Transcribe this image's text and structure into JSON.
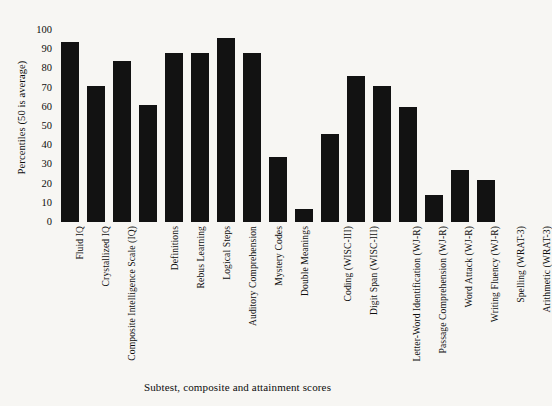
{
  "chart_data": {
    "type": "bar",
    "title": "",
    "xlabel": "Subtest, composite and attainment scores",
    "ylabel": "Percentiles (50 is average)",
    "ylim": [
      0,
      100
    ],
    "yticks": [
      "0",
      "10",
      "20",
      "30",
      "40",
      "50",
      "60",
      "70",
      "80",
      "90",
      "100"
    ],
    "grid": false,
    "legend": "none",
    "categories": [
      "Fluid IQ",
      "Crystallized IQ",
      "Composite Intelligence Scale (IQ)",
      "Definitions",
      "Rebus Learning",
      "Logical Steps",
      "Auditory Comprehension",
      "Mystery Codes",
      "Double Meanings",
      "Coding (WISC-III)",
      "Digit Span (WISC-III)",
      "Letter-Word  Identification (WJ-R)",
      "Passage Comprehension (WJ-R)",
      "Word Attack (WJ-R)",
      "Writing Fluency (WJ-R)",
      "Spelling (WRAT-3)",
      "Arithmetic (WRAT-3)"
    ],
    "values": [
      94,
      71,
      84,
      61,
      88,
      88,
      96,
      88,
      34,
      7,
      46,
      76,
      71,
      60,
      14,
      27,
      22
    ],
    "groups": [
      {
        "name": "composite-iq",
        "categories": [
          "Fluid IQ",
          "Crystallized IQ",
          "Composite Intelligence Scale (IQ)"
        ]
      },
      {
        "name": "kait-subtests",
        "categories": [
          "Definitions",
          "Rebus Learning",
          "Logical Steps",
          "Auditory Comprehension",
          "Mystery Codes",
          "Double Meanings"
        ]
      },
      {
        "name": "wisc-subtests",
        "categories": [
          "Coding (WISC-III)",
          "Digit Span (WISC-III)"
        ]
      },
      {
        "name": "attainment",
        "categories": [
          "Letter-Word  Identification (WJ-R)",
          "Passage Comprehension (WJ-R)",
          "Word Attack (WJ-R)",
          "Writing Fluency (WJ-R)",
          "Spelling (WRAT-3)",
          "Arithmetic (WRAT-3)"
        ]
      }
    ],
    "bar_color": "#121212",
    "background_color": "#f7f6f3"
  }
}
